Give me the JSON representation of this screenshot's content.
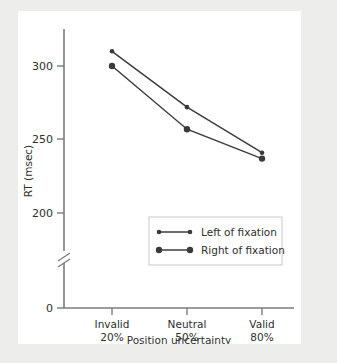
{
  "chart_data": {
    "type": "line",
    "title": "",
    "xlabel": "Position uncertainty",
    "ylabel": "RT (msec)",
    "categories": [
      "Invalid",
      "Neutral",
      "Valid"
    ],
    "category_sublabels": [
      "20%",
      "50%",
      "80%"
    ],
    "ytick_labels": [
      "0",
      "200",
      "250",
      "300"
    ],
    "ytick_values": [
      0,
      200,
      250,
      300
    ],
    "ylim": [
      195,
      315
    ],
    "axis_break": true,
    "axis_break_note": "y-axis broken between 0 and 200",
    "grid": false,
    "legend_position": "inside lower center-right",
    "series": [
      {
        "name": "Left of fixation",
        "values": [
          310,
          272,
          241
        ],
        "color": "#3a3a3a",
        "marker": "circle-small"
      },
      {
        "name": "Right of fixation",
        "values": [
          300,
          257,
          237
        ],
        "color": "#3a3a3a",
        "marker": "circle-large"
      }
    ]
  },
  "colors": {
    "page_background": "#ededec",
    "panel_background": "#ffffff",
    "axis": "#7b7b7b",
    "data": "#3a3a3a",
    "text": "#2e2e2e",
    "legend_border": "#c9c9c9"
  }
}
